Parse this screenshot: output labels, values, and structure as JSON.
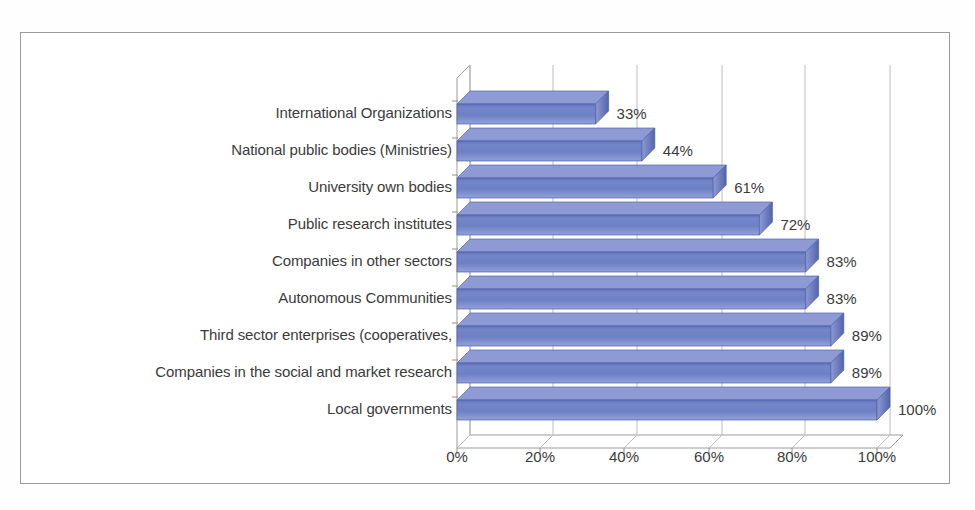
{
  "chart_data": {
    "type": "bar",
    "orientation": "horizontal",
    "style": "3d-bar",
    "title": "",
    "subtitle": "",
    "xlabel": "",
    "ylabel": "",
    "grid": true,
    "legend": "none",
    "xlim": [
      0,
      100
    ],
    "xticks": [
      "0%",
      "20%",
      "40%",
      "60%",
      "80%",
      "100%"
    ],
    "xtick_values": [
      0,
      20,
      40,
      60,
      80,
      100
    ],
    "categories": [
      "International Organizations",
      "National public bodies (Ministries)",
      "University own bodies",
      "Public research institutes",
      "Companies in other sectors",
      "Autonomous Communities",
      "Third sector enterprises (cooperatives,",
      "Companies in the social and market research",
      "Local governments"
    ],
    "values": [
      33,
      44,
      61,
      72,
      83,
      83,
      89,
      89,
      100
    ],
    "data_labels": [
      "33%",
      "44%",
      "61%",
      "72%",
      "83%",
      "83%",
      "89%",
      "89%",
      "100%"
    ],
    "series": [
      {
        "name": "Share",
        "values": [
          33,
          44,
          61,
          72,
          83,
          83,
          89,
          89,
          100
        ]
      }
    ],
    "colors": {
      "bar_face": "#6b7cc0",
      "bar_top": "#8d9ad4",
      "bar_side": "#4e5fa6",
      "bar_edge": "#3f4f94",
      "grid": "#b6b6b6",
      "axis": "#8f8f8f",
      "text": "#3b3b3b",
      "frame": "#9a9a9a",
      "background": "#ffffff"
    }
  }
}
